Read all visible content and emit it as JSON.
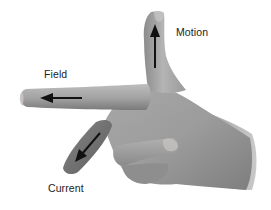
{
  "diagram": {
    "labels": {
      "motion": "Motion",
      "field": "Field",
      "current": "Current"
    },
    "arrows": [
      {
        "name": "motion-arrow",
        "direction": "up",
        "finger": "thumb"
      },
      {
        "name": "field-arrow",
        "direction": "left",
        "finger": "index"
      },
      {
        "name": "current-arrow",
        "direction": "down-left",
        "finger": "middle"
      }
    ],
    "colors": {
      "background": "#ffffff",
      "skin_light": "#b8b8b8",
      "skin_mid": "#9a9a9a",
      "skin_dark": "#6e6e6e",
      "arrow": "#111111",
      "text": "#222222"
    }
  }
}
